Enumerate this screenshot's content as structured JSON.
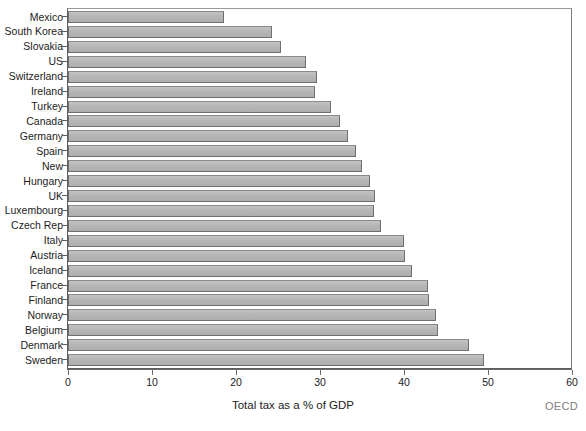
{
  "chart_data": {
    "type": "bar",
    "orientation": "horizontal",
    "title": "",
    "xlabel": "Total tax as a % of GDP",
    "ylabel": "",
    "xlim": [
      0,
      60
    ],
    "xticks": [
      0,
      10,
      20,
      30,
      40,
      50,
      60
    ],
    "grid": false,
    "legend": null,
    "source": "OECD",
    "bar_color": "#b6b6b6",
    "bar_edge_color": "#6f6f6f",
    "categories": [
      "Mexico",
      "South Korea",
      "Slovakia",
      "US",
      "Switzerland",
      "Ireland",
      "Turkey",
      "Canada",
      "Germany",
      "Spain",
      "New",
      "Hungary",
      "UK",
      "Luxembourg",
      "Czech Rep",
      "Italy",
      "Austria",
      "Iceland",
      "France",
      "Finland",
      "Norway",
      "Belgium",
      "Denmark",
      "Sweden"
    ],
    "values": [
      18.6,
      24.3,
      25.3,
      28.3,
      29.6,
      29.4,
      31.3,
      32.4,
      33.3,
      34.3,
      35.0,
      36.0,
      36.5,
      36.4,
      37.3,
      40.0,
      40.1,
      40.9,
      42.9,
      43.0,
      43.8,
      44.1,
      47.7,
      49.5
    ]
  }
}
